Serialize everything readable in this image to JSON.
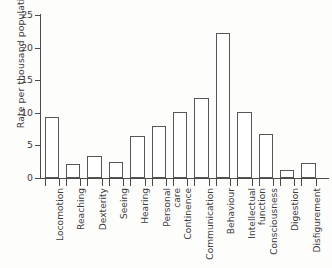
{
  "chart_data": {
    "type": "bar",
    "title": "",
    "xlabel": "",
    "ylabel": "Rate per thousand population",
    "ylim": [
      0,
      25
    ],
    "yticks": [
      0,
      5,
      10,
      15,
      20,
      25
    ],
    "grid": false,
    "legend": null,
    "categories": [
      "Locomotion",
      "Reaching",
      "Dexterity",
      "Seeing",
      "Hearing",
      "Personal care",
      "Continence",
      "Communication",
      "Behaviour",
      "Intellectual function",
      "Consciousness",
      "Digestion",
      "Disfigurement"
    ],
    "values": [
      9.3,
      2.1,
      3.4,
      2.5,
      6.5,
      8.0,
      10.2,
      12.2,
      22.2,
      10.2,
      6.7,
      1.2,
      2.3
    ],
    "bar_fill": "#ffffff",
    "bar_edge": "#565656",
    "axis_color": "#4a4a4a",
    "text_color": "#3c3c3c",
    "background": "#fdfdfc"
  },
  "axis": {
    "y_title": "Rate per thousand population",
    "y_tick_labels": [
      "0",
      "5",
      "10",
      "15",
      "20",
      "25"
    ]
  }
}
